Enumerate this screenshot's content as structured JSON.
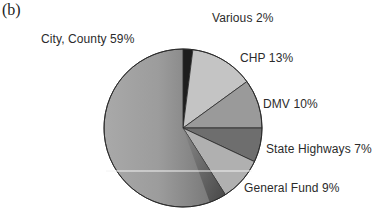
{
  "panel": {
    "label": "(b)"
  },
  "chart_data": {
    "type": "pie",
    "title": "",
    "start_angle": "12 o'clock",
    "direction": "clockwise",
    "categories": [
      "Various",
      "CHP",
      "DMV",
      "State Highways",
      "General Fund",
      "City, County"
    ],
    "values": [
      2,
      13,
      10,
      7,
      9,
      59
    ],
    "unit": "%",
    "labels": [
      "Various 2%",
      "CHP 13%",
      "DMV 10%",
      "State Highways 7%",
      "General Fund 9%",
      "City, County 59%"
    ],
    "colors": [
      "#1e1e1e",
      "#c4c4c4",
      "#9a9a9a",
      "#6e6e6e",
      "#b0b0b0",
      "#8c8c8c"
    ],
    "legend": "none (labels placed outside slices)",
    "grid": false
  }
}
